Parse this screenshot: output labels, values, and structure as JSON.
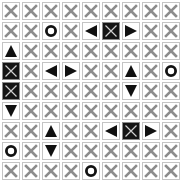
{
  "game": {
    "rows": 9,
    "cols": 9,
    "colors": {
      "cross_gray": "#8c8c8c",
      "cell_border": "#c4c4c4",
      "piece_black": "#111111",
      "dark_cell_bg": "#151515",
      "dark_cell_cross": "#d0d0d0"
    },
    "legend": {
      "X": "crossed-out-cell",
      "O": "circle-piece",
      "U": "triangle-up-piece",
      "D": "triangle-down-piece",
      "L": "triangle-left-piece",
      "R": "triangle-right-piece",
      "B": "dark-crossed-block"
    },
    "grid": [
      [
        "X",
        "X",
        "X",
        "X",
        "X",
        "X",
        "X",
        "X",
        "X"
      ],
      [
        "X",
        "X",
        "O",
        "X",
        "L",
        "B",
        "R",
        "X",
        "X"
      ],
      [
        "U",
        "X",
        "X",
        "X",
        "X",
        "X",
        "X",
        "X",
        "X"
      ],
      [
        "B",
        "X",
        "L",
        "R",
        "X",
        "X",
        "U",
        "X",
        "O"
      ],
      [
        "B",
        "X",
        "X",
        "X",
        "X",
        "X",
        "D",
        "X",
        "X"
      ],
      [
        "D",
        "X",
        "X",
        "X",
        "X",
        "X",
        "X",
        "X",
        "X"
      ],
      [
        "X",
        "X",
        "U",
        "X",
        "X",
        "L",
        "B",
        "R",
        "X"
      ],
      [
        "O",
        "X",
        "D",
        "X",
        "X",
        "X",
        "X",
        "X",
        "X"
      ],
      [
        "X",
        "X",
        "X",
        "X",
        "O",
        "X",
        "X",
        "X",
        "X"
      ]
    ]
  }
}
